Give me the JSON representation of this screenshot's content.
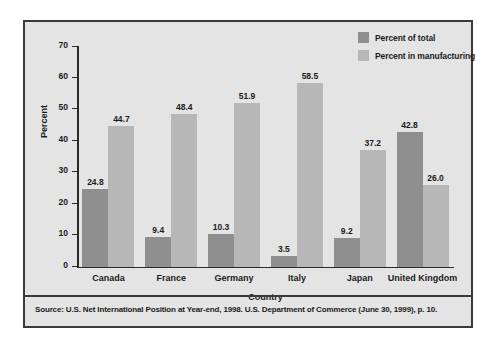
{
  "chart_data": {
    "type": "bar",
    "title": "",
    "xlabel": "Country",
    "ylabel": "Percent",
    "ylim": [
      0,
      70
    ],
    "yticks": [
      0,
      10,
      20,
      30,
      40,
      50,
      60,
      70
    ],
    "grid": false,
    "legend_position": "top-right",
    "categories": [
      "Canada",
      "France",
      "Germany",
      "Italy",
      "Japan",
      "United Kingdom"
    ],
    "series": [
      {
        "name": "Percent of total",
        "color": "#8f8f8f",
        "values": [
          24.8,
          9.4,
          10.3,
          3.5,
          9.2,
          42.8
        ],
        "labels": [
          "24.8",
          "9.4",
          "10.3",
          "3.5",
          "9.2",
          "42.8"
        ]
      },
      {
        "name": "Percent in manufacturing",
        "color": "#b7b7b7",
        "values": [
          44.7,
          48.4,
          51.9,
          58.5,
          37.2,
          26.0
        ],
        "labels": [
          "44.7",
          "48.4",
          "51.9",
          "58.5",
          "37.2",
          "26.0"
        ]
      }
    ]
  },
  "source": {
    "note": "Source: U.S. Net International Position at Year-end, 1998. U.S. Department of Commerce (June 30, 1999), p. 10."
  },
  "colors": {
    "series_dark": "#8f8f8f",
    "series_light": "#b7b7b7",
    "panel_background": "#e4e4e4",
    "frame": "#3a3a3a",
    "axis": "#2b2b2b",
    "text": "#1b1b1b"
  }
}
